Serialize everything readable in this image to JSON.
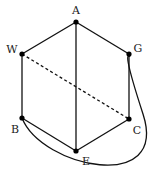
{
  "diagram": {
    "type": "graph",
    "nodes": [
      {
        "id": "A",
        "label": "A",
        "x": 76,
        "y": 22,
        "lx": 76,
        "ly": 10
      },
      {
        "id": "W",
        "label": "W",
        "x": 22,
        "y": 54,
        "lx": 12,
        "ly": 49
      },
      {
        "id": "G",
        "label": "G",
        "x": 129,
        "y": 54,
        "lx": 138,
        "ly": 48
      },
      {
        "id": "B",
        "label": "B",
        "x": 22,
        "y": 118,
        "lx": 15,
        "ly": 129
      },
      {
        "id": "C",
        "label": "C",
        "x": 129,
        "y": 119,
        "lx": 137,
        "ly": 130
      },
      {
        "id": "E",
        "label": "E",
        "x": 76,
        "y": 151,
        "lx": 86,
        "ly": 161
      }
    ],
    "edges": [
      {
        "from": "A",
        "to": "W",
        "style": "solid"
      },
      {
        "from": "A",
        "to": "G",
        "style": "solid"
      },
      {
        "from": "A",
        "to": "E",
        "style": "solid"
      },
      {
        "from": "W",
        "to": "B",
        "style": "solid"
      },
      {
        "from": "G",
        "to": "C",
        "style": "solid"
      },
      {
        "from": "B",
        "to": "E",
        "style": "solid"
      },
      {
        "from": "E",
        "to": "C",
        "style": "solid"
      },
      {
        "from": "W",
        "to": "C",
        "style": "dashed"
      },
      {
        "from": "B",
        "to": "G",
        "style": "solid",
        "curved": true
      }
    ]
  }
}
